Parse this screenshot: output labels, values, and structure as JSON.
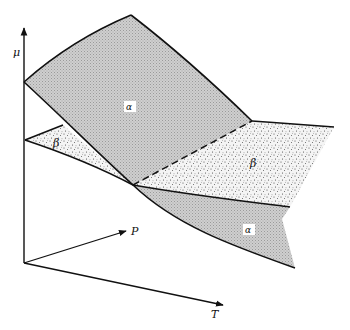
{
  "diagram": {
    "type": "3d-surface-schematic",
    "axes": {
      "vertical": {
        "label": "μ"
      },
      "depth": {
        "label": "P"
      },
      "horizontal": {
        "label": "T"
      }
    },
    "surfaces": [
      {
        "id": "alpha-upper",
        "label": "α",
        "fill": "#c8c8c8",
        "pattern": "fine-grid"
      },
      {
        "id": "beta-left",
        "label": "β",
        "fill": "#f2f2f2",
        "pattern": "stipple"
      },
      {
        "id": "beta-right",
        "label": "β",
        "fill": "#f2f2f2",
        "pattern": "stipple"
      },
      {
        "id": "alpha-lower",
        "label": "α",
        "fill": "#c8c8c8",
        "pattern": "fine-grid"
      }
    ],
    "intersection_line": {
      "style": "dashed",
      "description": "coexistence curve where α and β surfaces intersect"
    },
    "colors": {
      "line": "#111111",
      "alpha_fill": "#c8c8c8",
      "beta_fill": "#f2f2f2",
      "background": "#ffffff"
    }
  }
}
